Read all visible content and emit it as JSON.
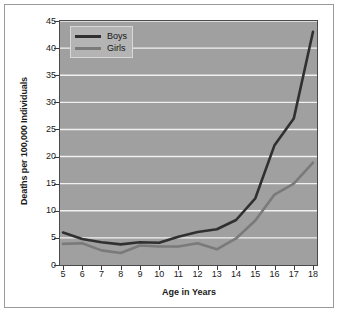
{
  "chart_data": {
    "type": "line",
    "title": "",
    "xlabel": "Age in Years",
    "ylabel": "Deaths per 100,000 Individuals",
    "x": [
      5,
      6,
      7,
      8,
      9,
      10,
      11,
      12,
      13,
      14,
      15,
      16,
      17,
      18
    ],
    "categories": [
      "5",
      "6",
      "7",
      "8",
      "9",
      "10",
      "11",
      "12",
      "13",
      "14",
      "15",
      "16",
      "17",
      "18"
    ],
    "xlim": [
      5,
      18
    ],
    "ylim": [
      0,
      45
    ],
    "yticks": [
      0,
      5,
      10,
      15,
      20,
      25,
      30,
      35,
      40,
      45
    ],
    "ytick_labels": [
      "0",
      "5",
      "10",
      "15",
      "20",
      "25",
      "30",
      "35",
      "40",
      "45"
    ],
    "grid": "horizontal",
    "legend_position": "top-left",
    "series": [
      {
        "name": "Boys",
        "color": "#303030",
        "values": [
          6.0,
          4.8,
          4.2,
          3.8,
          4.2,
          4.1,
          5.2,
          6.1,
          6.6,
          8.3,
          12.3,
          22.1,
          27.0,
          43.0
        ]
      },
      {
        "name": "Girls",
        "color": "#7a7a7a",
        "values": [
          3.9,
          4.0,
          2.7,
          2.2,
          3.6,
          3.4,
          3.4,
          4.0,
          2.9,
          4.9,
          8.2,
          13.0,
          15.0,
          18.9
        ]
      }
    ]
  },
  "legend": {
    "items": [
      {
        "label": "Boys"
      },
      {
        "label": "Girls"
      }
    ]
  },
  "colors": {
    "plot_background": "#a0a0a0",
    "gridline": "#f0f0f0",
    "boys_line": "#303030",
    "girls_line": "#7a7a7a",
    "page_background": "#ffffff",
    "axis": "#3a3a3a"
  }
}
